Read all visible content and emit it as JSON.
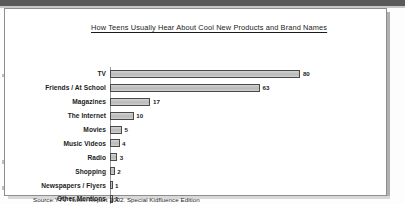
{
  "figure": {
    "title": "How Teens Usually Hear About Cool New Products and Brand Names",
    "source": "Source:YTV Tween Report 2002. Special Kidfluence Edition",
    "percent_symbol": "%"
  },
  "chart_data": {
    "type": "bar",
    "orientation": "horizontal",
    "title": "How Teens Usually Hear About Cool New Products and Brand Names",
    "xlabel": "%",
    "ylabel": "",
    "xlim": [
      0,
      100
    ],
    "xticks": [
      0,
      10,
      20,
      30,
      40,
      50,
      60,
      70,
      80,
      90,
      100
    ],
    "grid": false,
    "legend": null,
    "categories": [
      "TV",
      "Friends / At School",
      "Magazines",
      "The Internet",
      "Movies",
      "Music Videos",
      "Radio",
      "Shopping",
      "Newspapers / Flyers",
      "Other Mentions"
    ],
    "values": [
      80,
      63,
      17,
      10,
      5,
      4,
      3,
      2,
      1,
      1
    ],
    "value_labels": [
      "80",
      "63",
      "17",
      "10",
      "5",
      "4",
      "3",
      "2",
      "1",
      "1"
    ],
    "bar_fill": "#c6c6c6",
    "bar_edge": "#4a4a4a",
    "source_note": "Source:YTV Tween Report 2002. Special Kidfluence Edition"
  }
}
